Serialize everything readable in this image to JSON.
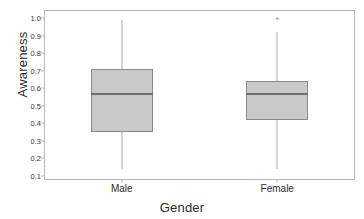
{
  "chart_data": {
    "type": "box",
    "title": "",
    "xlabel": "Gender",
    "ylabel": "Awareness",
    "categories": [
      "Male",
      "Female"
    ],
    "ylim": [
      0.1,
      1.0
    ],
    "yticks": [
      "1.0",
      "0.9",
      "0.8",
      "0.7",
      "0.6",
      "0.5",
      "0.4",
      "0.3",
      "0.2",
      "0.1"
    ],
    "ytick_values": [
      1.0,
      0.9,
      0.8,
      0.7,
      0.6,
      0.5,
      0.4,
      0.3,
      0.2,
      0.1
    ],
    "grid": false,
    "legend": "none",
    "boxes": [
      {
        "name": "Male",
        "whisker_low": 0.14,
        "q1": 0.35,
        "median": 0.57,
        "q3": 0.71,
        "whisker_high": 0.99,
        "outliers": []
      },
      {
        "name": "Female",
        "whisker_low": 0.14,
        "q1": 0.42,
        "median": 0.57,
        "q3": 0.64,
        "whisker_high": 0.92,
        "outliers": [
          0.99
        ]
      }
    ],
    "colors": {
      "box_fill": "#c9c9c9",
      "box_edge": "#8a8a8a",
      "median": "#6e6e6e",
      "whisker": "#a9a9a9",
      "frame": "#b9b9b9",
      "text": "#2b2b2b"
    },
    "outlier_marker": "*"
  }
}
